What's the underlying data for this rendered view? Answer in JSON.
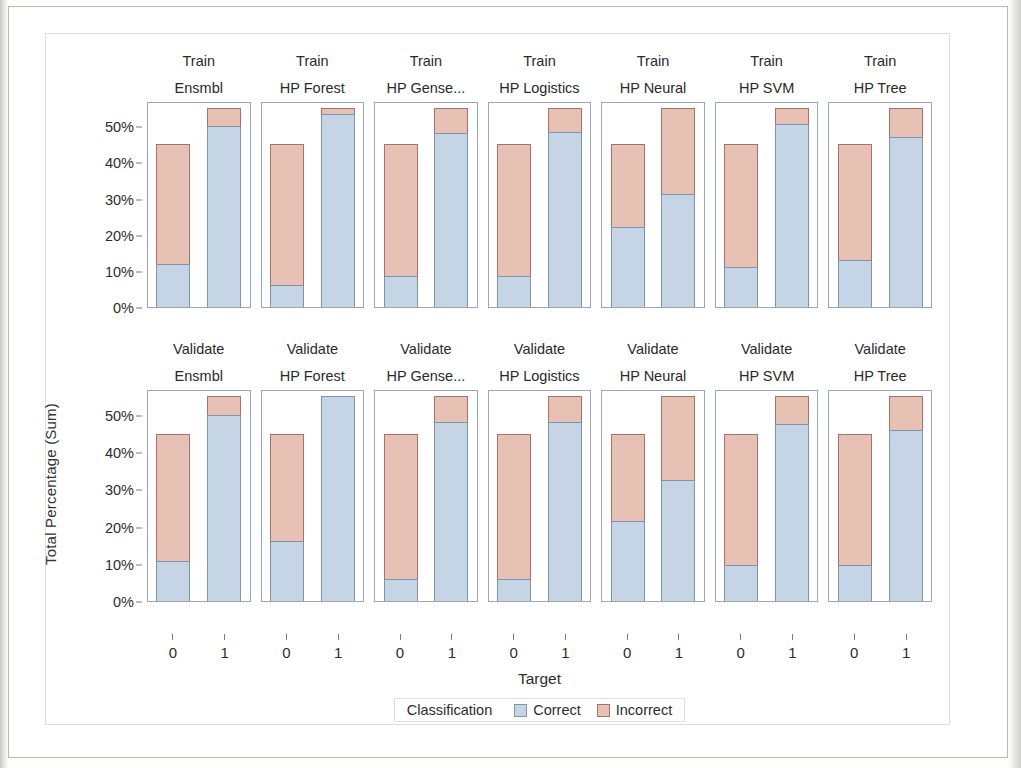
{
  "chart_data": {
    "type": "bar",
    "title": "",
    "subtitle": "",
    "xlabel": "Target",
    "ylabel": "Total Percentage (Sum)",
    "stacked": true,
    "ylim": [
      0,
      57
    ],
    "ytick_labels": [
      "0%",
      "10%",
      "20%",
      "30%",
      "40%",
      "50%"
    ],
    "ytick_values": [
      0,
      10,
      20,
      30,
      40,
      50
    ],
    "xtick_labels": [
      "0",
      "1"
    ],
    "grid": false,
    "legend_position": "bottom",
    "legend_title": "Classification",
    "series": [
      {
        "name": "Correct",
        "color": "#c6d5e5"
      },
      {
        "name": "Incorrect",
        "color": "#e7c1b4"
      }
    ],
    "row_labels": [
      "Train",
      "Validate"
    ],
    "column_labels": [
      "Ensmbl",
      "HP Forest",
      "HP Gense...",
      "HP Logistics",
      "HP Neural",
      "HP SVM",
      "HP Tree"
    ],
    "panels": [
      {
        "row": "Train",
        "model": "Ensmbl",
        "bars": [
          {
            "x": "0",
            "correct": 11.8,
            "incorrect": 33.2,
            "total": 45.0
          },
          {
            "x": "1",
            "correct": 50.0,
            "incorrect": 5.0,
            "total": 55.0
          }
        ]
      },
      {
        "row": "Train",
        "model": "HP Forest",
        "bars": [
          {
            "x": "0",
            "correct": 6.2,
            "incorrect": 38.8,
            "total": 45.0
          },
          {
            "x": "1",
            "correct": 53.5,
            "incorrect": 1.5,
            "total": 55.0
          }
        ]
      },
      {
        "row": "Train",
        "model": "HP Gense...",
        "bars": [
          {
            "x": "0",
            "correct": 8.6,
            "incorrect": 36.4,
            "total": 45.0
          },
          {
            "x": "1",
            "correct": 48.2,
            "incorrect": 6.8,
            "total": 55.0
          }
        ]
      },
      {
        "row": "Train",
        "model": "HP Logistics",
        "bars": [
          {
            "x": "0",
            "correct": 8.6,
            "incorrect": 36.4,
            "total": 45.0
          },
          {
            "x": "1",
            "correct": 48.4,
            "incorrect": 6.6,
            "total": 55.0
          }
        ]
      },
      {
        "row": "Train",
        "model": "HP Neural",
        "bars": [
          {
            "x": "0",
            "correct": 22.0,
            "incorrect": 23.0,
            "total": 45.0
          },
          {
            "x": "1",
            "correct": 31.2,
            "incorrect": 23.8,
            "total": 55.0
          }
        ]
      },
      {
        "row": "Train",
        "model": "HP SVM",
        "bars": [
          {
            "x": "0",
            "correct": 11.2,
            "incorrect": 33.8,
            "total": 45.0
          },
          {
            "x": "1",
            "correct": 50.6,
            "incorrect": 4.4,
            "total": 55.0
          }
        ]
      },
      {
        "row": "Train",
        "model": "HP Tree",
        "bars": [
          {
            "x": "0",
            "correct": 13.1,
            "incorrect": 31.9,
            "total": 45.0
          },
          {
            "x": "1",
            "correct": 47.0,
            "incorrect": 8.0,
            "total": 55.0
          }
        ]
      },
      {
        "row": "Validate",
        "model": "Ensmbl",
        "bars": [
          {
            "x": "0",
            "correct": 10.8,
            "incorrect": 34.2,
            "total": 45.0
          },
          {
            "x": "1",
            "correct": 50.0,
            "incorrect": 5.0,
            "total": 55.0
          }
        ]
      },
      {
        "row": "Validate",
        "model": "HP Forest",
        "bars": [
          {
            "x": "0",
            "correct": 16.0,
            "incorrect": 29.0,
            "total": 45.0
          },
          {
            "x": "1",
            "correct": 55.0,
            "incorrect": 0.0,
            "total": 55.0
          }
        ]
      },
      {
        "row": "Validate",
        "model": "HP Gense...",
        "bars": [
          {
            "x": "0",
            "correct": 6.0,
            "incorrect": 39.0,
            "total": 45.0
          },
          {
            "x": "1",
            "correct": 48.0,
            "incorrect": 7.0,
            "total": 55.0
          }
        ]
      },
      {
        "row": "Validate",
        "model": "HP Logistics",
        "bars": [
          {
            "x": "0",
            "correct": 6.0,
            "incorrect": 39.0,
            "total": 45.0
          },
          {
            "x": "1",
            "correct": 48.0,
            "incorrect": 7.0,
            "total": 55.0
          }
        ]
      },
      {
        "row": "Validate",
        "model": "HP Neural",
        "bars": [
          {
            "x": "0",
            "correct": 21.5,
            "incorrect": 23.5,
            "total": 45.0
          },
          {
            "x": "1",
            "correct": 32.5,
            "incorrect": 22.5,
            "total": 55.0
          }
        ]
      },
      {
        "row": "Validate",
        "model": "HP SVM",
        "bars": [
          {
            "x": "0",
            "correct": 9.8,
            "incorrect": 35.2,
            "total": 45.0
          },
          {
            "x": "1",
            "correct": 47.5,
            "incorrect": 7.5,
            "total": 55.0
          }
        ]
      },
      {
        "row": "Validate",
        "model": "HP Tree",
        "bars": [
          {
            "x": "0",
            "correct": 9.8,
            "incorrect": 35.2,
            "total": 45.0
          },
          {
            "x": "1",
            "correct": 46.0,
            "incorrect": 9.0,
            "total": 55.0
          }
        ]
      }
    ]
  }
}
